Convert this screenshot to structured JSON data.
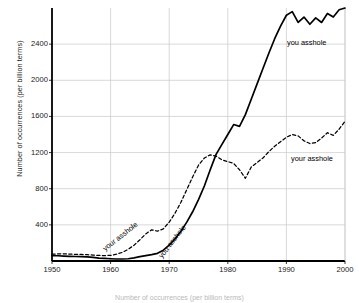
{
  "chart_data": {
    "type": "line",
    "title": "",
    "xlabel": "",
    "ylabel": "Number of occurrences (per billion terms)",
    "xlim": [
      1950,
      2000
    ],
    "ylim": [
      0,
      2800
    ],
    "xticks": [
      1950,
      1960,
      1970,
      1980,
      1990,
      2000
    ],
    "yticks": [
      400,
      800,
      1200,
      1600,
      2000,
      2400
    ],
    "grid": true,
    "legend_position": "inline-annotations",
    "x": [
      1950,
      1951,
      1952,
      1953,
      1954,
      1955,
      1956,
      1957,
      1958,
      1959,
      1960,
      1961,
      1962,
      1963,
      1964,
      1965,
      1966,
      1967,
      1968,
      1969,
      1970,
      1971,
      1972,
      1973,
      1974,
      1975,
      1976,
      1977,
      1978,
      1979,
      1980,
      1981,
      1982,
      1983,
      1984,
      1985,
      1986,
      1987,
      1988,
      1989,
      1990,
      1991,
      1992,
      1993,
      1994,
      1995,
      1996,
      1997,
      1998,
      1999,
      2000
    ],
    "series": [
      {
        "name": "you asshole",
        "style": "solid",
        "color": "#000000",
        "values": [
          60,
          58,
          55,
          52,
          50,
          48,
          45,
          40,
          32,
          28,
          25,
          22,
          22,
          25,
          35,
          48,
          60,
          70,
          85,
          120,
          175,
          245,
          330,
          430,
          545,
          680,
          830,
          1010,
          1180,
          1290,
          1400,
          1510,
          1490,
          1620,
          1790,
          1960,
          2130,
          2300,
          2460,
          2600,
          2720,
          2760,
          2640,
          2700,
          2620,
          2690,
          2640,
          2740,
          2700,
          2780,
          2800
        ]
      },
      {
        "name": "your asshole",
        "style": "dashed",
        "color": "#000000",
        "values": [
          75,
          78,
          80,
          76,
          74,
          72,
          70,
          66,
          62,
          60,
          62,
          75,
          95,
          130,
          175,
          235,
          300,
          345,
          330,
          355,
          430,
          530,
          650,
          790,
          930,
          1060,
          1140,
          1175,
          1160,
          1120,
          1100,
          1080,
          1010,
          915,
          1040,
          1090,
          1140,
          1210,
          1270,
          1320,
          1370,
          1400,
          1385,
          1330,
          1300,
          1310,
          1360,
          1420,
          1390,
          1460,
          1545
        ]
      }
    ],
    "annotations": [
      {
        "name": "you-asshole-right",
        "text": "you asshole",
        "x": 287,
        "y": 39,
        "rotation": 0
      },
      {
        "name": "your-asshole-right",
        "text": "your asshole",
        "x": 291,
        "y": 155,
        "rotation": 0
      },
      {
        "name": "your-asshole-rotated",
        "text": "your asshole",
        "x": 106,
        "y": 245,
        "rotation": -38
      },
      {
        "name": "you-asshole-rotated",
        "text": "you asshole",
        "x": 163,
        "y": 252,
        "rotation": -52
      }
    ],
    "caption": "Number of occurrences (per billion terms)"
  }
}
